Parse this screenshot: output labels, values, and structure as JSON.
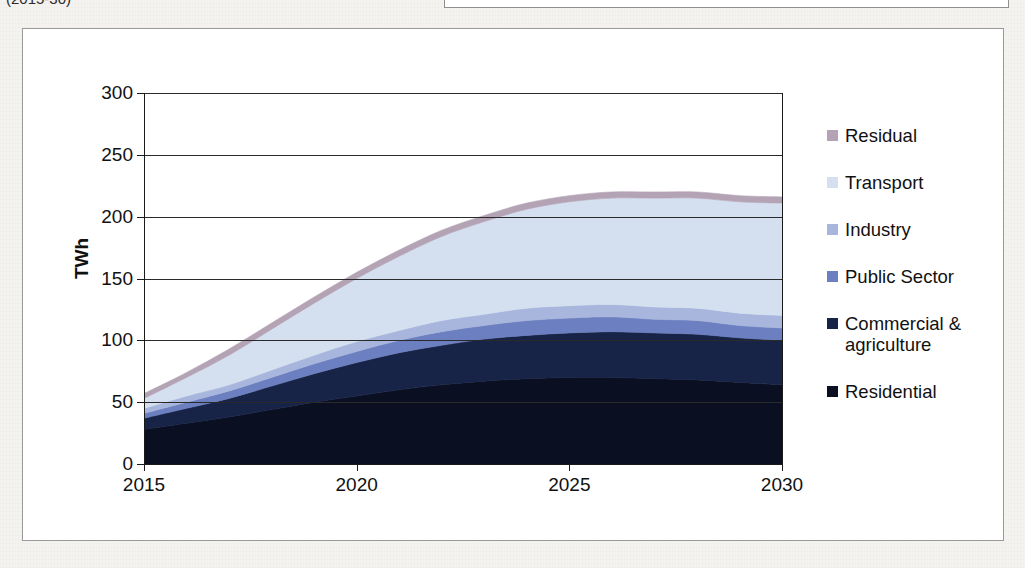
{
  "page": {
    "background_color": "#f4f3f0",
    "top_left_caption": "(2015-30)"
  },
  "chart": {
    "frame_border_color": "#9a9a9a",
    "plot_background": "#ffffff",
    "axis_color": "#1a1a1a"
  },
  "legend": {
    "position": "right",
    "items": [
      {
        "label": "Residual",
        "color": "#b3a3b5"
      },
      {
        "label": "Transport",
        "color": "#d4e0ef"
      },
      {
        "label": "Industry",
        "color": "#a8b5dd"
      },
      {
        "label": "Public Sector",
        "color": "#6c7fc0"
      },
      {
        "label": "Commercial & agriculture",
        "color": "#172447"
      },
      {
        "label": "Residential",
        "color": "#0b0f22"
      }
    ]
  },
  "chart_data": {
    "type": "area",
    "stacked": true,
    "title": "",
    "subtitle": "",
    "xlabel": "",
    "ylabel": "TWh",
    "xlim": [
      2015,
      2030
    ],
    "ylim": [
      0,
      300
    ],
    "ytick_labels": [
      "0",
      "50",
      "100",
      "150",
      "200",
      "250",
      "300"
    ],
    "yticks": [
      0,
      50,
      100,
      150,
      200,
      250,
      300
    ],
    "xtick_labels": [
      "2015",
      "2020",
      "2025",
      "2030"
    ],
    "xticks": [
      2015,
      2020,
      2025,
      2030
    ],
    "grid": "horizontal",
    "legend_position": "right",
    "x": [
      2015,
      2016,
      2017,
      2018,
      2019,
      2020,
      2021,
      2022,
      2023,
      2024,
      2025,
      2026,
      2027,
      2028,
      2029,
      2030
    ],
    "series": [
      {
        "name": "Residential",
        "color": "#0b0f22",
        "values": [
          28,
          33,
          38,
          44,
          50,
          55,
          60,
          64,
          67,
          69,
          70,
          70,
          69,
          68,
          66,
          64
        ]
      },
      {
        "name": "Commercial & agriculture",
        "color": "#172447",
        "values": [
          9,
          12,
          15,
          19,
          23,
          27,
          30,
          32,
          34,
          35,
          36,
          37,
          37,
          37,
          36,
          36
        ]
      },
      {
        "name": "Public Sector",
        "color": "#6c7fc0",
        "values": [
          4,
          5,
          6,
          7,
          8,
          9,
          10,
          11,
          11,
          12,
          12,
          12,
          11,
          11,
          10,
          10
        ]
      },
      {
        "name": "Industry",
        "color": "#a8b5dd",
        "values": [
          4,
          5,
          5,
          6,
          7,
          8,
          8,
          9,
          9,
          10,
          10,
          10,
          10,
          10,
          10,
          10
        ]
      },
      {
        "name": "Transport",
        "color": "#d4e0ef",
        "values": [
          8,
          15,
          24,
          33,
          42,
          51,
          60,
          68,
          75,
          80,
          84,
          86,
          88,
          89,
          90,
          91
        ]
      },
      {
        "name": "Residual",
        "color": "#b3a3b5",
        "values": [
          4,
          4,
          5,
          5,
          5,
          5,
          5,
          5,
          5,
          5,
          5,
          5,
          5,
          5,
          5,
          5
        ]
      }
    ],
    "totals": [
      57,
      74,
      93,
      114,
      135,
      155,
      173,
      189,
      201,
      211,
      217,
      220,
      220,
      220,
      217,
      216
    ]
  }
}
